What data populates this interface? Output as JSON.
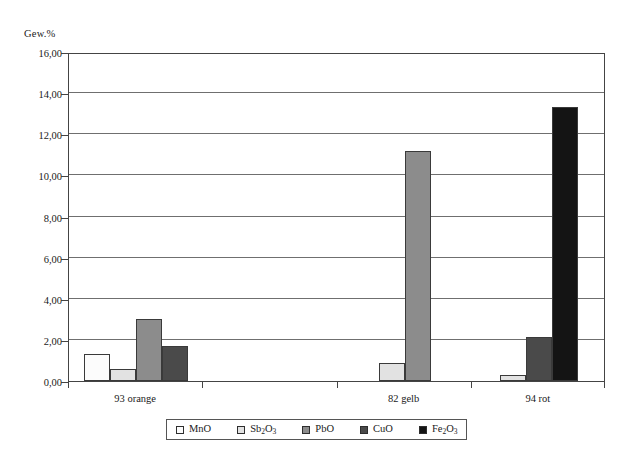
{
  "chart_data": {
    "type": "bar",
    "title": "",
    "subtitle": "",
    "xlabel": "",
    "ylabel": "Gew.%",
    "ylim": [
      0,
      16
    ],
    "ytick_step": 2,
    "ytick_labels": [
      "0,00",
      "2,00",
      "4,00",
      "6,00",
      "8,00",
      "10,00",
      "12,00",
      "14,00",
      "16,00"
    ],
    "ytick_values": [
      0,
      2,
      4,
      6,
      8,
      10,
      12,
      14,
      16
    ],
    "grid": "horizontal",
    "legend_position": "bottom",
    "categories": [
      "93 orange",
      "",
      "82 gelb",
      "94 rot"
    ],
    "category_slots": 4,
    "series": [
      {
        "name": "MnO",
        "label_html": "MnO",
        "color": "#fcfcfc",
        "values": [
          1.3,
          0,
          0,
          0
        ]
      },
      {
        "name": "Sb2O3",
        "label_html": "Sb<sub>2</sub>O<sub>3</sub>",
        "color": "#e2e2e2",
        "values": [
          0.6,
          0,
          0.9,
          0.28
        ]
      },
      {
        "name": "PbO",
        "label_html": "PbO",
        "color": "#8c8c8c",
        "values": [
          3.0,
          0,
          11.2,
          0
        ]
      },
      {
        "name": "CuO",
        "label_html": "CuO",
        "color": "#4a4a4a",
        "values": [
          1.7,
          0,
          0,
          2.15
        ]
      },
      {
        "name": "Fe2O3",
        "label_html": "Fe<sub>2</sub>O<sub>3</sub>",
        "color": "#141414",
        "values": [
          0,
          0,
          0,
          13.35
        ]
      }
    ],
    "axis_color": "#444444",
    "gridline_color": "#6f6f6f"
  }
}
